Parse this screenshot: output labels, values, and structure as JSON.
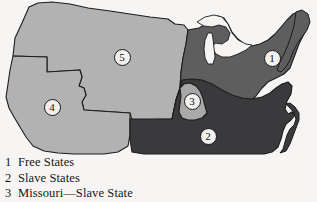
{
  "figure": {
    "background_color": "#f6f5f3"
  },
  "map": {
    "name": "united-states-free-and-slave-states-map",
    "regions": [
      {
        "id": "free-states",
        "name": "Free States",
        "fill": "#5e5e5e",
        "stroke": "#1c1c1e"
      },
      {
        "id": "slave-states",
        "name": "Slave States",
        "fill": "#3a3a3c",
        "stroke": "#1c1c1e"
      },
      {
        "id": "missouri",
        "name": "Missouri—Slave State",
        "fill": "#a9a9a9",
        "stroke": "#1c1c1e"
      },
      {
        "id": "southwest-territory",
        "name": "Southwest Territory",
        "fill": "#b2b2b2",
        "stroke": "#1c1c1e"
      },
      {
        "id": "northwest-territory",
        "name": "Northwest Territory",
        "fill": "#b2b2b2",
        "stroke": "#1c1c1e"
      },
      {
        "id": "great-lakes",
        "name": "Great Lakes",
        "fill": "#f6f5f3",
        "stroke": "#1c1c1e"
      }
    ],
    "markers": [
      {
        "number": "1",
        "x": 272,
        "y": 58,
        "region": "free-states"
      },
      {
        "number": "2",
        "x": 208,
        "y": 136,
        "region": "slave-states"
      },
      {
        "number": "3",
        "x": 192,
        "y": 101,
        "region": "missouri"
      },
      {
        "number": "4",
        "x": 52,
        "y": 107,
        "region": "southwest-territory"
      },
      {
        "number": "5",
        "x": 122,
        "y": 57,
        "region": "northwest-territory"
      }
    ]
  },
  "legend": {
    "items": [
      {
        "number": "1",
        "label": "Free States"
      },
      {
        "number": "2",
        "label": "Slave States"
      },
      {
        "number": "3",
        "label": "Missouri—Slave State"
      }
    ]
  }
}
